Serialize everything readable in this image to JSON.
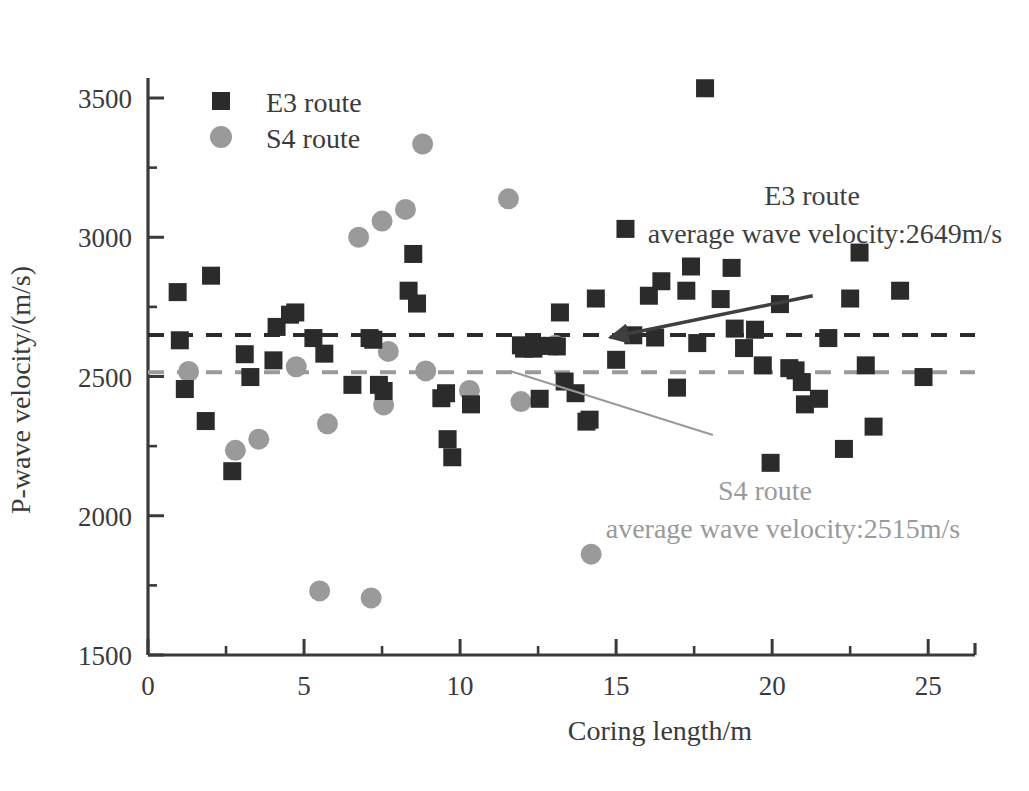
{
  "chart_data": {
    "type": "scatter",
    "title": "",
    "xlabel": "Coring length/m",
    "ylabel": "P-wave velocity/(m/s)",
    "xlim": [
      0,
      26.5
    ],
    "ylim": [
      1500,
      3500
    ],
    "xticks": [
      0,
      5,
      10,
      15,
      20,
      25
    ],
    "yticks": [
      1500,
      2000,
      2500,
      3000,
      3500
    ],
    "xtick_labels": [
      "0",
      "5",
      "10",
      "15",
      "20",
      "25"
    ],
    "ytick_labels": [
      "1500",
      "2000",
      "2500",
      "3000",
      "3500"
    ],
    "x_minor_interval": 2.5,
    "y_minor_interval": 250,
    "grid": false,
    "legend_position": "upper-left",
    "series": [
      {
        "name": "E3 route",
        "marker": "square",
        "color": "#2b2b2b",
        "points": [
          [
            0.95,
            2803
          ],
          [
            1.02,
            2630
          ],
          [
            1.18,
            2455
          ],
          [
            1.85,
            2340
          ],
          [
            2.02,
            2862
          ],
          [
            2.7,
            2160
          ],
          [
            3.1,
            2580
          ],
          [
            3.28,
            2498
          ],
          [
            4.02,
            2558
          ],
          [
            4.12,
            2678
          ],
          [
            4.55,
            2722
          ],
          [
            4.72,
            2730
          ],
          [
            5.3,
            2638
          ],
          [
            5.65,
            2582
          ],
          [
            6.55,
            2470
          ],
          [
            7.1,
            2638
          ],
          [
            7.22,
            2632
          ],
          [
            7.4,
            2470
          ],
          [
            7.55,
            2448
          ],
          [
            8.35,
            2808
          ],
          [
            8.5,
            2940
          ],
          [
            8.62,
            2762
          ],
          [
            9.4,
            2422
          ],
          [
            9.55,
            2440
          ],
          [
            9.6,
            2275
          ],
          [
            9.75,
            2210
          ],
          [
            10.35,
            2400
          ],
          [
            11.95,
            2612
          ],
          [
            12.05,
            2600
          ],
          [
            12.35,
            2600
          ],
          [
            12.45,
            2610
          ],
          [
            12.55,
            2420
          ],
          [
            12.95,
            2610
          ],
          [
            13.1,
            2608
          ],
          [
            13.2,
            2730
          ],
          [
            13.35,
            2482
          ],
          [
            13.7,
            2440
          ],
          [
            14.05,
            2338
          ],
          [
            14.15,
            2345
          ],
          [
            14.35,
            2780
          ],
          [
            15.0,
            2560
          ],
          [
            15.3,
            3030
          ],
          [
            15.55,
            2648
          ],
          [
            16.05,
            2790
          ],
          [
            16.25,
            2640
          ],
          [
            16.45,
            2842
          ],
          [
            16.95,
            2460
          ],
          [
            17.25,
            2808
          ],
          [
            17.4,
            2895
          ],
          [
            17.6,
            2620
          ],
          [
            17.85,
            3535
          ],
          [
            18.35,
            2778
          ],
          [
            18.7,
            2890
          ],
          [
            18.8,
            2672
          ],
          [
            19.1,
            2602
          ],
          [
            19.45,
            2668
          ],
          [
            19.7,
            2540
          ],
          [
            19.95,
            2190
          ],
          [
            20.25,
            2760
          ],
          [
            20.55,
            2530
          ],
          [
            20.75,
            2522
          ],
          [
            20.95,
            2480
          ],
          [
            21.05,
            2400
          ],
          [
            21.5,
            2420
          ],
          [
            21.8,
            2638
          ],
          [
            22.3,
            2240
          ],
          [
            22.5,
            2780
          ],
          [
            22.8,
            2945
          ],
          [
            23.0,
            2540
          ],
          [
            23.25,
            2320
          ],
          [
            24.1,
            2808
          ],
          [
            24.85,
            2498
          ]
        ],
        "mean_value": 2649,
        "mean_label_line1": "E3 route",
        "mean_label_line2": "average wave velocity:2649m/s"
      },
      {
        "name": "S4 route",
        "marker": "circle",
        "color": "#9a9a9a",
        "points": [
          [
            1.3,
            2518
          ],
          [
            2.8,
            2235
          ],
          [
            3.55,
            2275
          ],
          [
            4.75,
            2535
          ],
          [
            5.5,
            1730
          ],
          [
            5.75,
            2330
          ],
          [
            7.15,
            1705
          ],
          [
            7.55,
            2398
          ],
          [
            7.7,
            2590
          ],
          [
            6.75,
            3000
          ],
          [
            7.5,
            3058
          ],
          [
            8.25,
            3100
          ],
          [
            8.8,
            3335
          ],
          [
            8.9,
            2520
          ],
          [
            10.3,
            2450
          ],
          [
            11.55,
            3138
          ],
          [
            11.95,
            2410
          ],
          [
            13.05,
            2612
          ],
          [
            14.2,
            1862
          ]
        ],
        "mean_value": 2515,
        "mean_label_line1": "S4 route",
        "mean_label_line2": "average wave velocity:2515m/s"
      }
    ],
    "annotations": [
      {
        "id": "e3-annotation",
        "line1": "E3 route",
        "line2": "average wave velocity:2649m/s",
        "color": "#3f3f3f",
        "arrow_from": [
          21.3,
          2790
        ],
        "arrow_to": [
          14.8,
          2640
        ]
      },
      {
        "id": "s4-annotation",
        "line1": "S4 route",
        "line2": "average wave velocity:2515m/s",
        "color": "#9a9a9a",
        "arrow_from": [
          11.6,
          2520
        ],
        "arrow_to": [
          18.1,
          2290
        ]
      }
    ],
    "legend": [
      {
        "label": "E3 route",
        "marker": "square",
        "color": "#2b2b2b"
      },
      {
        "label": "S4 route",
        "marker": "circle",
        "color": "#9a9a9a"
      }
    ]
  }
}
